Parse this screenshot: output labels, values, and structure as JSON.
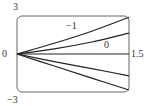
{
  "chart_data": {
    "type": "line",
    "title": "",
    "xlabel": "",
    "ylabel": "",
    "xlim": [
      0,
      1.5
    ],
    "ylim": [
      -3,
      3
    ],
    "grid": false,
    "legend": "none",
    "axis_labels": {
      "y_top": "3",
      "y_bottom": "−3",
      "x_left": "0",
      "x_right": "1.5"
    },
    "annotations": [
      {
        "text": "−1",
        "target_series": "upper"
      },
      {
        "text": "0",
        "target_series": "second"
      }
    ],
    "series": [
      {
        "name": "upper",
        "x": [
          0,
          0.5,
          1.0,
          1.5
        ],
        "y": [
          0,
          0.85,
          1.8,
          2.9
        ]
      },
      {
        "name": "second",
        "x": [
          0,
          0.5,
          1.0,
          1.5
        ],
        "y": [
          0,
          0.4,
          0.95,
          1.65
        ]
      },
      {
        "name": "middle",
        "x": [
          0,
          0.5,
          1.0,
          1.5
        ],
        "y": [
          0,
          0,
          0,
          0
        ]
      },
      {
        "name": "fourth",
        "x": [
          0,
          0.5,
          1.0,
          1.5
        ],
        "y": [
          0,
          -0.6,
          -1.15,
          -1.73
        ]
      },
      {
        "name": "lower",
        "x": [
          0,
          0.5,
          1.0,
          1.5
        ],
        "y": [
          0,
          -0.95,
          -1.9,
          -2.84
        ]
      }
    ]
  },
  "colors": {
    "line": "#222222",
    "frame": "#555555",
    "text": "#333333"
  }
}
